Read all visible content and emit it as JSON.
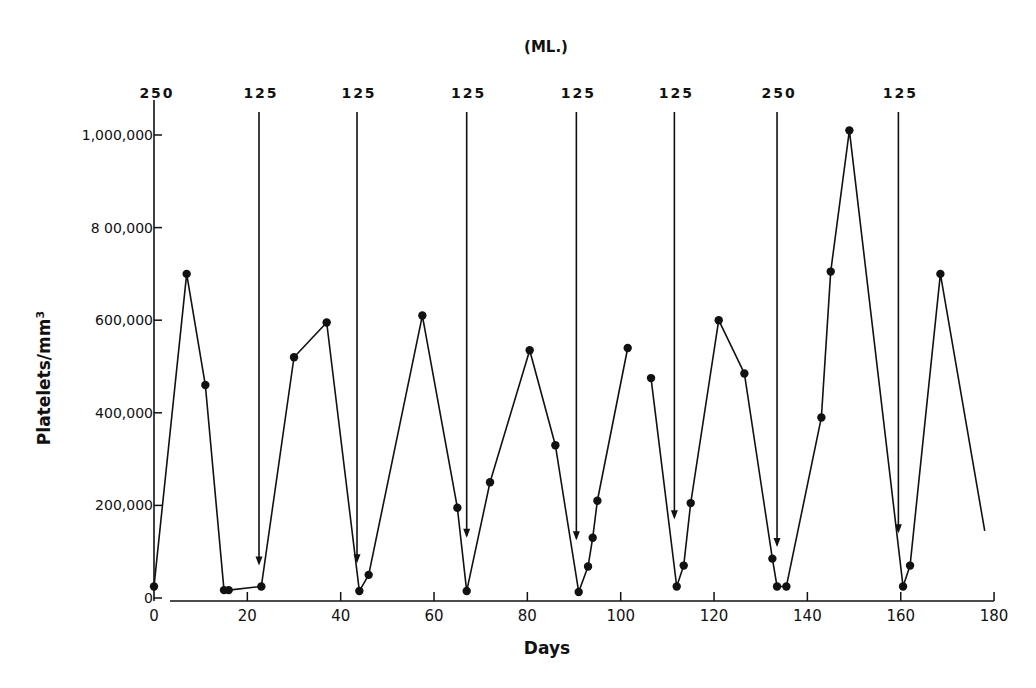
{
  "chart_data": {
    "type": "line",
    "title": "(ML.)",
    "xlabel": "Days",
    "ylabel": "Platelets/mm³",
    "xlim": [
      0,
      180
    ],
    "ylim": [
      0,
      1000000
    ],
    "x_ticks": [
      0,
      20,
      40,
      60,
      80,
      100,
      120,
      140,
      160,
      180
    ],
    "y_ticks": [
      0,
      200000,
      400000,
      600000,
      800000,
      1000000
    ],
    "y_tick_labels": [
      "0",
      "200,000",
      "400,000",
      "600,000",
      "8 00,000",
      "1,000,000"
    ],
    "grid": false,
    "legend": null,
    "series": [
      {
        "name": "Platelets",
        "segments": [
          {
            "points": [
              [
                0,
                25000
              ],
              [
                7,
                700000
              ],
              [
                11,
                460000
              ],
              [
                15,
                17000
              ],
              [
                16,
                17000
              ],
              [
                23,
                25000
              ],
              [
                30,
                520000
              ],
              [
                37,
                595000
              ],
              [
                44,
                15000
              ],
              [
                46,
                50000
              ],
              [
                57.5,
                610000
              ],
              [
                65,
                195000
              ],
              [
                67,
                15000
              ],
              [
                72,
                250000
              ],
              [
                80.5,
                535000
              ],
              [
                86,
                330000
              ],
              [
                91,
                13000
              ],
              [
                93,
                68000
              ],
              [
                94,
                130000
              ],
              [
                95,
                210000
              ],
              [
                101.5,
                540000
              ]
            ]
          },
          {
            "points": [
              [
                106.5,
                475000
              ],
              [
                112,
                25000
              ],
              [
                113.5,
                70000
              ],
              [
                115,
                205000
              ],
              [
                121,
                600000
              ],
              [
                126.5,
                485000
              ],
              [
                132.5,
                85000
              ],
              [
                133.5,
                25000
              ],
              [
                135.5,
                25000
              ],
              [
                143,
                390000
              ],
              [
                145,
                705000
              ],
              [
                149,
                1010000
              ],
              [
                160.5,
                25000
              ],
              [
                162,
                70000
              ],
              [
                168.5,
                700000
              ]
            ],
            "tail_end_no_marker": [
              178,
              145000
            ]
          }
        ]
      }
    ],
    "annotations": {
      "unit_label": "(ML.)",
      "transfusion_arrows": [
        {
          "day": 0,
          "volume_ml": "250",
          "arrow_end_value": null
        },
        {
          "day": 22.5,
          "volume_ml": "125",
          "arrow_end_value": 70000
        },
        {
          "day": 43.5,
          "volume_ml": "125",
          "arrow_end_value": 75000
        },
        {
          "day": 67,
          "volume_ml": "125",
          "arrow_end_value": 130000
        },
        {
          "day": 90.5,
          "volume_ml": "125",
          "arrow_end_value": 125000
        },
        {
          "day": 111.5,
          "volume_ml": "125",
          "arrow_end_value": 170000
        },
        {
          "day": 133.5,
          "volume_ml": "250",
          "arrow_end_value": 110000
        },
        {
          "day": 159.5,
          "volume_ml": "125",
          "arrow_end_value": 140000
        }
      ]
    }
  },
  "labels": {
    "title": "(ML.)",
    "xlabel": "Days",
    "ylabel_main": "Platelets/mm",
    "ylabel_sup": "3",
    "x_ticks": [
      "0",
      "20",
      "40",
      "60",
      "80",
      "100",
      "120",
      "140",
      "160",
      "180"
    ],
    "y_ticks": [
      "0",
      "200,000",
      "400,000",
      "600,000",
      "8 00,000",
      "1,000,000"
    ],
    "arrow_labels": [
      "250",
      "125",
      "125",
      "125",
      "125",
      "125",
      "250",
      "125"
    ]
  }
}
